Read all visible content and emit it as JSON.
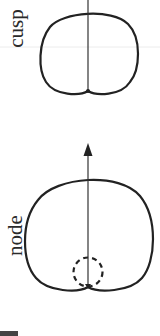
{
  "figure": {
    "panels": [
      {
        "id": "cusp",
        "label": "cusp",
        "curve": "cardioid with cusp at bottom",
        "features": [
          "vertical line through cusp point"
        ]
      },
      {
        "id": "node",
        "label": "node",
        "curve": "cardioid-like curve with node at bottom",
        "features": [
          "upward arrow through node point",
          "dashed inner loop circle"
        ]
      }
    ],
    "colors": {
      "stroke": "#222222",
      "guide": "#e6e6e6",
      "background": "#ffffff"
    }
  }
}
